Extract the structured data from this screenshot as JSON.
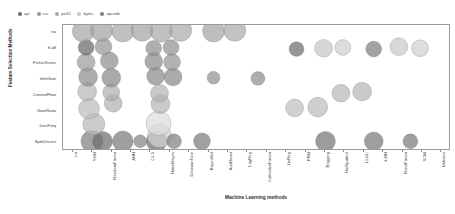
{
  "legend": {
    "position": "top-left",
    "items": [
      {
        "label": "api",
        "color": "#6b6b6b"
      },
      {
        "label": "rss",
        "color": "#9a9a9a"
      },
      {
        "label": "pe32",
        "color": "#a8a8a8"
      },
      {
        "label": "bytes",
        "color": "#c8c8c8"
      },
      {
        "label": "opcode",
        "color": "#7d7d7d"
      }
    ]
  },
  "chart_data": {
    "type": "scatter",
    "title": "",
    "xlabel": "Machine Learning methods",
    "ylabel": "Feature Selection Methods",
    "grid": false,
    "categories_x": [
      "no",
      "SVM",
      "RandomForest",
      "ANN",
      "C4.5",
      "NaiveBayes",
      "DecisionTree",
      "BayesNet",
      "AdaBoost",
      "LogReg",
      "CollectiveForest",
      "LinReg",
      "PRM",
      "Bagging",
      "HotSpotted",
      "LLGC",
      "k-NN",
      "RandForest",
      "SOM",
      "kMeans"
    ],
    "categories_y": [
      "SymUncert",
      "DocFreq",
      "GainRatio",
      "ControlFlow",
      "InfoGain",
      "FisherScore",
      "tf-idf",
      "no"
    ],
    "xlim": [
      0,
      20
    ],
    "ylim": [
      0,
      8
    ],
    "points": [
      {
        "x": 1,
        "y": 0,
        "r": 11,
        "color": "#808080",
        "series": "api"
      },
      {
        "x": 1.55,
        "y": 0,
        "r": 10,
        "color": "#6f6f6f",
        "series": "opcode"
      },
      {
        "x": 2.6,
        "y": 0,
        "r": 10.5,
        "color": "#7a7a7a",
        "series": "api"
      },
      {
        "x": 3.5,
        "y": 0,
        "r": 6.5,
        "color": "#828282",
        "series": "rss"
      },
      {
        "x": 4.35,
        "y": 0,
        "r": 10.5,
        "color": "#6e6e6e",
        "series": "opcode"
      },
      {
        "x": 4.5,
        "y": 0.35,
        "r": 12,
        "color": "#d2d2d2",
        "series": "bytes"
      },
      {
        "x": 5.25,
        "y": 0,
        "r": 7.5,
        "color": "#7f7f7f",
        "series": "api"
      },
      {
        "x": 6.7,
        "y": 0,
        "r": 8.5,
        "color": "#7c7c7c",
        "series": "api"
      },
      {
        "x": 13.1,
        "y": 0,
        "r": 10,
        "color": "#767676",
        "series": "opcode"
      },
      {
        "x": 15.6,
        "y": 0,
        "r": 9.5,
        "color": "#787878",
        "series": "api"
      },
      {
        "x": 17.5,
        "y": 0,
        "r": 7.5,
        "color": "#7b7b7b",
        "series": "opcode"
      },
      {
        "x": 1.1,
        "y": 1.1,
        "r": 11,
        "color": "#b8b8b8",
        "series": "pe32"
      },
      {
        "x": 4.45,
        "y": 1.15,
        "r": 12.5,
        "color": "#dcdcdc",
        "series": "bytes"
      },
      {
        "x": 0.85,
        "y": 2.1,
        "r": 10.5,
        "color": "#bcbcbc",
        "series": "pe32"
      },
      {
        "x": 2.1,
        "y": 2.45,
        "r": 9,
        "color": "#b2b2b2",
        "series": "pe32"
      },
      {
        "x": 4.55,
        "y": 2.4,
        "r": 9.5,
        "color": "#b5b5b5",
        "series": "pe32"
      },
      {
        "x": 11.5,
        "y": 2.15,
        "r": 9,
        "color": "#bfbfbf",
        "series": "pe32"
      },
      {
        "x": 12.7,
        "y": 2.2,
        "r": 10,
        "color": "#bdbdbd",
        "series": "pe32"
      },
      {
        "x": 0.75,
        "y": 3.2,
        "r": 9.5,
        "color": "#b7b7b7",
        "series": "pe32"
      },
      {
        "x": 2.0,
        "y": 3.15,
        "r": 8.5,
        "color": "#afafaf",
        "series": "pe32"
      },
      {
        "x": 4.5,
        "y": 3.1,
        "r": 9,
        "color": "#b4b4b4",
        "series": "pe32"
      },
      {
        "x": 13.9,
        "y": 3.1,
        "r": 9,
        "color": "#b9b9b9",
        "series": "pe32"
      },
      {
        "x": 15.0,
        "y": 3.2,
        "r": 9.5,
        "color": "#b6b6b6",
        "series": "pe32"
      },
      {
        "x": 0.8,
        "y": 4.15,
        "r": 9.5,
        "color": "#8d8d8d",
        "series": "rss"
      },
      {
        "x": 2.0,
        "y": 4.1,
        "r": 9.5,
        "color": "#898989",
        "series": "rss"
      },
      {
        "x": 4.3,
        "y": 4.2,
        "r": 9,
        "color": "#8b8b8b",
        "series": "rss"
      },
      {
        "x": 5.2,
        "y": 4.15,
        "r": 9,
        "color": "#8a8a8a",
        "series": "rss"
      },
      {
        "x": 7.3,
        "y": 4.1,
        "r": 6.5,
        "color": "#909090",
        "series": "rss"
      },
      {
        "x": 9.6,
        "y": 4.05,
        "r": 7,
        "color": "#8e8e8e",
        "series": "rss"
      },
      {
        "x": 0.7,
        "y": 5.1,
        "r": 9,
        "color": "#9c9c9c",
        "series": "rss"
      },
      {
        "x": 1.9,
        "y": 5.2,
        "r": 9,
        "color": "#8f8f8f",
        "series": "rss"
      },
      {
        "x": 4.2,
        "y": 5.15,
        "r": 9,
        "color": "#8c8c8c",
        "series": "rss"
      },
      {
        "x": 5.15,
        "y": 5.1,
        "r": 8.5,
        "color": "#949494",
        "series": "rss"
      },
      {
        "x": 0.7,
        "y": 6.05,
        "r": 8,
        "color": "#6a6a6a",
        "series": "opcode"
      },
      {
        "x": 1.6,
        "y": 6.1,
        "r": 8.5,
        "color": "#979797",
        "series": "rss"
      },
      {
        "x": 4.2,
        "y": 6.0,
        "r": 8,
        "color": "#8f8f8f",
        "series": "rss"
      },
      {
        "x": 5.1,
        "y": 6.05,
        "r": 8,
        "color": "#929292",
        "series": "rss"
      },
      {
        "x": 11.6,
        "y": 5.95,
        "r": 7.5,
        "color": "#6d6d6d",
        "series": "opcode"
      },
      {
        "x": 13.0,
        "y": 6.0,
        "r": 9,
        "color": "#c6c6c6",
        "series": "bytes"
      },
      {
        "x": 14.0,
        "y": 6.05,
        "r": 8,
        "color": "#cfcfcf",
        "series": "bytes"
      },
      {
        "x": 15.6,
        "y": 5.95,
        "r": 8,
        "color": "#7e7e7e",
        "series": "opcode"
      },
      {
        "x": 16.9,
        "y": 6.1,
        "r": 9,
        "color": "#c9c9c9",
        "series": "bytes"
      },
      {
        "x": 18.0,
        "y": 6.0,
        "r": 8.5,
        "color": "#d0d0d0",
        "series": "bytes"
      },
      {
        "x": 0.55,
        "y": 7.1,
        "r": 11,
        "color": "#a6a6a6",
        "series": "pe32"
      },
      {
        "x": 1.5,
        "y": 7.15,
        "r": 11,
        "color": "#a2a2a2",
        "series": "pe32"
      },
      {
        "x": 2.6,
        "y": 7.1,
        "r": 11,
        "color": "#a9a9a9",
        "series": "pe32"
      },
      {
        "x": 3.6,
        "y": 7.15,
        "r": 11,
        "color": "#a4a4a4",
        "series": "pe32"
      },
      {
        "x": 4.6,
        "y": 7.1,
        "r": 11,
        "color": "#a7a7a7",
        "series": "pe32"
      },
      {
        "x": 5.6,
        "y": 7.15,
        "r": 11,
        "color": "#ababab",
        "series": "pe32"
      },
      {
        "x": 7.3,
        "y": 7.1,
        "r": 11,
        "color": "#a5a5a5",
        "series": "pe32"
      },
      {
        "x": 8.4,
        "y": 7.15,
        "r": 11,
        "color": "#aaaaaa",
        "series": "pe32"
      }
    ]
  }
}
